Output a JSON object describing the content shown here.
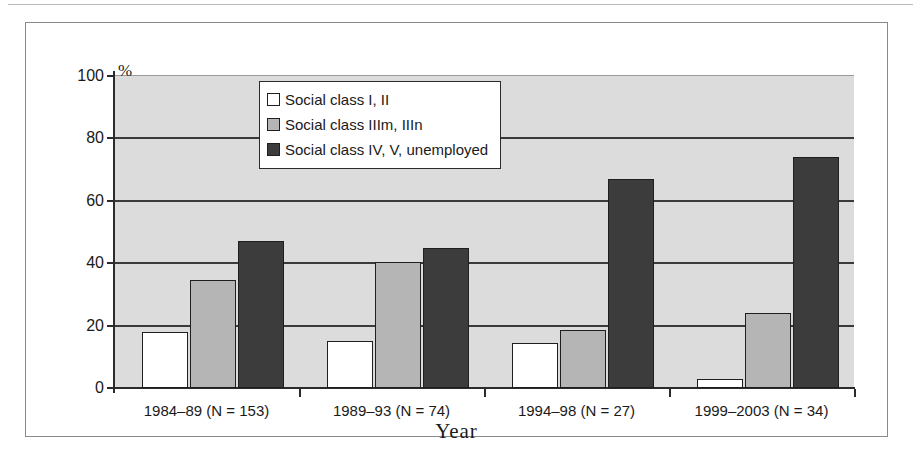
{
  "chart_data": {
    "type": "bar",
    "title": "",
    "xlabel": "Year",
    "ylabel": "%",
    "ylim": [
      0,
      100
    ],
    "ytick_step": 20,
    "yticks": [
      "100",
      "80",
      "60",
      "40",
      "20",
      "0"
    ],
    "grid": true,
    "legend_position": "upper-center-right",
    "categories": [
      "1984–89 (N = 153)",
      "1989–93 (N = 74)",
      "1994–98 (N = 27)",
      "1999–2003 (N = 34)"
    ],
    "series": [
      {
        "name": "Social class I, II",
        "color": "#ffffff",
        "values": [
          18,
          15,
          14.5,
          3
        ]
      },
      {
        "name": "Social class IIIm, IIIn",
        "color": "#b5b5b5",
        "values": [
          34.5,
          40.5,
          18.5,
          24
        ]
      },
      {
        "name": "Social class IV, V, unemployed",
        "color": "#3c3c3c",
        "values": [
          47,
          45,
          67,
          74
        ]
      }
    ]
  },
  "legend": {
    "items": [
      {
        "label": "Social class I, II",
        "swatch": "swatch-white"
      },
      {
        "label": "Social class IIIm, IIIn",
        "swatch": "swatch-gray"
      },
      {
        "label": "Social class IV, V, unemployed",
        "swatch": "swatch-dark"
      }
    ]
  },
  "axes": {
    "y_unit_label": "%",
    "x_title": "Year"
  },
  "colors": {
    "plot_background": "#dcdcdc",
    "gridline": "#3a3a3a",
    "frame": "#8a8a8a",
    "series_light": "#ffffff",
    "series_mid": "#b5b5b5",
    "series_dark": "#3c3c3c"
  }
}
